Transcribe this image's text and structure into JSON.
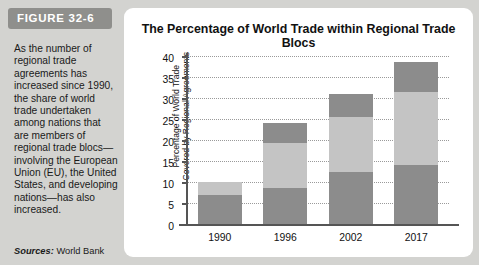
{
  "figure": {
    "badge_label": "FIGURE 32-6",
    "caption": "As the number of regional trade agreements has increased since 1990, the share of world trade undertaken among nations that are members of regional trade blocs—involving the European Union (EU), the United States, and developing nations—has also increased.",
    "source_prefix": "Sources:",
    "source_text": "World Bank"
  },
  "colors": {
    "panel_background": "#d3d3d0",
    "card_background": "#ffffff",
    "badge_background": "#8f8f8c",
    "segment_dark": "#8c8c8c",
    "segment_light": "#c4c4c4",
    "axis": "#555555",
    "gridline": "#9a9a9a",
    "text": "#111111"
  },
  "chart_data": {
    "type": "bar",
    "title": "The Percentage of World Trade within Regional Trade Blocs",
    "xlabel": "",
    "ylabel": "Percentage of World Trade Covered by Regional Agreements",
    "ylabel_lines": [
      "Percentage of World Trade",
      "Covered by Regional Agreements"
    ],
    "categories": [
      "1990",
      "1996",
      "2002",
      "2017"
    ],
    "ylim": [
      0,
      40
    ],
    "yticks": [
      0,
      5,
      10,
      15,
      20,
      25,
      30,
      35,
      40
    ],
    "ytick_labels": [
      "0",
      "5",
      "10",
      "15",
      "20",
      "25",
      "30",
      "35",
      "40"
    ],
    "grid": true,
    "stacked": true,
    "legend": "none",
    "series": [
      {
        "name": "lower-segment",
        "color": "#8c8c8c",
        "values": [
          7.0,
          8.5,
          12.3,
          14.0
        ]
      },
      {
        "name": "middle-segment",
        "color": "#c4c4c4",
        "values": [
          3.0,
          10.7,
          13.2,
          17.5
        ]
      },
      {
        "name": "upper-segment",
        "color": "#8c8c8c",
        "values": [
          0.0,
          4.8,
          5.5,
          7.0
        ]
      }
    ],
    "totals": [
      10.0,
      24.0,
      31.0,
      38.5
    ]
  }
}
